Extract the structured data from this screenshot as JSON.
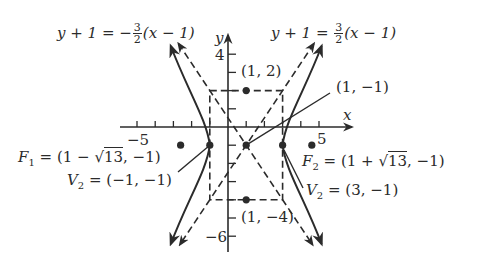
{
  "figure": {
    "type": "hyperbola-graph",
    "equation_left_asymptote": {
      "lhs": "y + 1 =",
      "sign": "−",
      "num": "3",
      "den": "2",
      "rhs": "(x − 1)"
    },
    "equation_right_asymptote": {
      "lhs": "y + 1 =",
      "sign": "",
      "num": "3",
      "den": "2",
      "rhs": "(x − 1)"
    },
    "axes": {
      "x_label": "x",
      "y_label": "y",
      "x_tick_labels": [
        "−5",
        "5"
      ],
      "y_tick_labels": [
        "4",
        "−6"
      ]
    },
    "points": {
      "top": "(1, 2)",
      "bottom": "(1, −4)",
      "center": "(1, −1)"
    },
    "foci": {
      "f1_name": "F",
      "f1_sub": "1",
      "f1_value_pre": "= (1 − ",
      "f1_sqrt": "13",
      "f1_value_post": ", −1)",
      "f2_name": "F",
      "f2_sub": "2",
      "f2_value_pre": "= (1 + ",
      "f2_sqrt": "13",
      "f2_value_post": ", −1)"
    },
    "vertices": {
      "left_name": "V",
      "left_sub": "2",
      "left_value": "= (−1, −1)",
      "right_name": "V",
      "right_sub": "2",
      "right_value": "= (3, −1)"
    },
    "colors": {
      "ink": "#2b2b2b",
      "background": "#ffffff"
    }
  }
}
